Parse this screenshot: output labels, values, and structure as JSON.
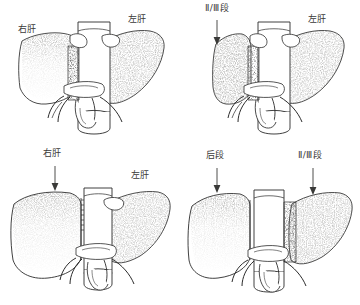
{
  "figure": {
    "background_color": "#ffffff",
    "ink_color": "#2b2b2b",
    "layout": "2x2 grid of line drawings"
  },
  "panels": [
    {
      "id": "top-left",
      "position": "top-left",
      "description": "肝脏正位示意，右肝与左肝分别标注",
      "labels": [
        {
          "text": "右肝",
          "has_arrow": false,
          "x": 18,
          "y": 25
        },
        {
          "text": "左肝",
          "has_arrow": false,
          "x": 128,
          "y": 15
        }
      ]
    },
    {
      "id": "top-right",
      "position": "top-right",
      "description": "肝脏示意，左外叶 II/III 段与左肝标注",
      "labels": [
        {
          "text": "Ⅱ/Ⅲ段",
          "has_arrow": true,
          "x": 205,
          "y": 4
        },
        {
          "text": "左肝",
          "has_arrow": false,
          "x": 308,
          "y": 15
        }
      ]
    },
    {
      "id": "bottom-left",
      "position": "bottom-left",
      "description": "肝脏示意，右肝带箭头指示，左肝标注",
      "labels": [
        {
          "text": "右肝",
          "has_arrow": true,
          "x": 46,
          "y": 150
        },
        {
          "text": "左肝",
          "has_arrow": false,
          "x": 134,
          "y": 172
        }
      ]
    },
    {
      "id": "bottom-right",
      "position": "bottom-right",
      "description": "肝脏示意，后段与 II/III 段均带箭头指示",
      "labels": [
        {
          "text": "后段",
          "has_arrow": true,
          "x": 208,
          "y": 152
        },
        {
          "text": "Ⅱ/Ⅲ段",
          "has_arrow": true,
          "x": 300,
          "y": 152
        }
      ]
    }
  ],
  "labels_flat": {
    "right_liver": "右肝",
    "left_liver": "左肝",
    "segment_2_3": "Ⅱ/Ⅲ段",
    "posterior_segment": "后段"
  }
}
